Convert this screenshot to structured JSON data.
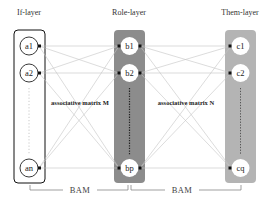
{
  "layers": [
    {
      "name": "If-layer",
      "nodes": [
        "a1",
        "a2",
        "an"
      ],
      "fill": "#ffffff",
      "stroke": "#111111"
    },
    {
      "name": "Role-layer",
      "nodes": [
        "b1",
        "b2",
        "bp"
      ],
      "fill": "#8c8c8c",
      "stroke": "#8c8c8c"
    },
    {
      "name": "Them-layer",
      "nodes": [
        "c1",
        "c2",
        "cq"
      ],
      "fill": "#b4b4b4",
      "stroke": "#b4b4b4"
    }
  ],
  "matrices": {
    "left": "associative matrix M",
    "right": "associative matrix N"
  },
  "bam": {
    "left": "BAM",
    "right": "BAM"
  },
  "colors": {
    "edge": "#bdbdbd",
    "node_fill": "#ffffff",
    "port": "#111111"
  }
}
